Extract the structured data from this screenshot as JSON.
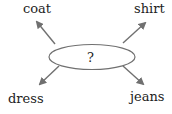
{
  "diagram": {
    "center": {
      "label": "?"
    },
    "nodes": [
      {
        "id": "coat",
        "label": "coat",
        "position": "top-left"
      },
      {
        "id": "shirt",
        "label": "shirt",
        "position": "top-right"
      },
      {
        "id": "dress",
        "label": "dress",
        "position": "bottom-left"
      },
      {
        "id": "jeans",
        "label": "jeans",
        "position": "bottom-right"
      }
    ],
    "colors": {
      "stroke": "#707070",
      "text": "#222222"
    }
  }
}
